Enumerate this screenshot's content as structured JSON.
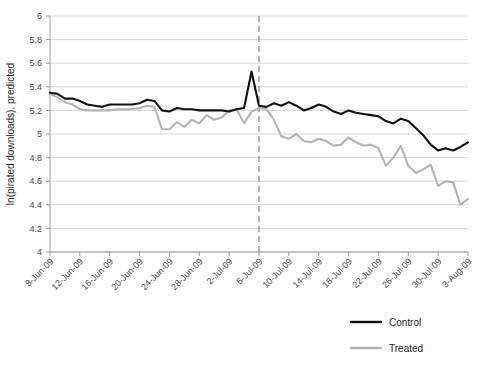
{
  "chart_data": {
    "type": "line",
    "title": "",
    "xlabel": "",
    "ylabel": "ln(pirated downloads), predicted",
    "ylim": [
      4,
      6
    ],
    "ytick_step": 0.2,
    "yticks": [
      "6",
      "5.8",
      "5.6",
      "5.4",
      "5.2",
      "5",
      "4.8",
      "4.6",
      "4.4",
      "4.2",
      "4"
    ],
    "grid": true,
    "legend_position": "bottom-right",
    "x": [
      "8-Jun-09",
      "9-Jun-09",
      "10-Jun-09",
      "11-Jun-09",
      "12-Jun-09",
      "13-Jun-09",
      "14-Jun-09",
      "15-Jun-09",
      "16-Jun-09",
      "17-Jun-09",
      "18-Jun-09",
      "19-Jun-09",
      "20-Jun-09",
      "21-Jun-09",
      "22-Jun-09",
      "23-Jun-09",
      "24-Jun-09",
      "25-Jun-09",
      "26-Jun-09",
      "27-Jun-09",
      "28-Jun-09",
      "29-Jun-09",
      "30-Jun-09",
      "1-Jul-09",
      "2-Jul-09",
      "3-Jul-09",
      "4-Jul-09",
      "5-Jul-09",
      "6-Jul-09",
      "7-Jul-09",
      "8-Jul-09",
      "9-Jul-09",
      "10-Jul-09",
      "11-Jul-09",
      "12-Jul-09",
      "13-Jul-09",
      "14-Jul-09",
      "15-Jul-09",
      "16-Jul-09",
      "17-Jul-09",
      "18-Jul-09",
      "19-Jul-09",
      "20-Jul-09",
      "21-Jul-09",
      "22-Jul-09",
      "23-Jul-09",
      "24-Jul-09",
      "25-Jul-09",
      "26-Jul-09",
      "27-Jul-09",
      "28-Jul-09",
      "29-Jul-09",
      "30-Jul-09",
      "31-Jul-09",
      "1-Aug-09",
      "2-Aug-09",
      "3-Aug-09"
    ],
    "xtick_labels": [
      "8-Jun-09",
      "12-Jun-09",
      "16-Jun-09",
      "20-Jun-09",
      "24-Jun-09",
      "28-Jun-09",
      "2-Jul-09",
      "6-Jul-09",
      "10-Jul-09",
      "14-Jul-09",
      "18-Jul-09",
      "22-Jul-09",
      "26-Jul-09",
      "30-Jul-09",
      "3-Aug-09"
    ],
    "xtick_indices": [
      0,
      4,
      8,
      12,
      16,
      20,
      24,
      28,
      32,
      36,
      40,
      44,
      48,
      52,
      56
    ],
    "series": [
      {
        "name": "Control",
        "color": "#111111",
        "values": [
          5.35,
          5.34,
          5.3,
          5.3,
          5.28,
          5.25,
          5.24,
          5.23,
          5.25,
          5.25,
          5.25,
          5.25,
          5.26,
          5.29,
          5.28,
          5.2,
          5.19,
          5.22,
          5.21,
          5.21,
          5.2,
          5.2,
          5.2,
          5.2,
          5.19,
          5.21,
          5.22,
          5.53,
          5.24,
          5.23,
          5.26,
          5.24,
          5.27,
          5.24,
          5.2,
          5.22,
          5.25,
          5.23,
          5.19,
          5.17,
          5.2,
          5.18,
          5.17,
          5.16,
          5.15,
          5.11,
          5.09,
          5.13,
          5.11,
          5.05,
          4.99,
          4.91,
          4.86,
          4.88,
          4.86,
          4.89,
          4.93
        ]
      },
      {
        "name": "Treated",
        "color": "#b3b3b3",
        "values": [
          5.34,
          5.31,
          5.27,
          5.25,
          5.21,
          5.2,
          5.2,
          5.2,
          5.2,
          5.21,
          5.21,
          5.21,
          5.22,
          5.24,
          5.23,
          5.04,
          5.04,
          5.1,
          5.06,
          5.12,
          5.09,
          5.16,
          5.12,
          5.14,
          5.2,
          5.21,
          5.09,
          5.19,
          5.22,
          5.21,
          5.12,
          4.98,
          4.96,
          5.0,
          4.94,
          4.93,
          4.96,
          4.94,
          4.9,
          4.91,
          4.97,
          4.93,
          4.9,
          4.91,
          4.88,
          4.73,
          4.8,
          4.9,
          4.73,
          4.67,
          4.7,
          4.74,
          4.56,
          4.6,
          4.59,
          4.4,
          4.45
        ]
      }
    ],
    "annotations": [
      {
        "type": "vertical-dashed-line",
        "at_index": 28,
        "at_label": "6-Jul-09",
        "color": "#8c8c8c"
      }
    ]
  },
  "legend": {
    "items": [
      {
        "label": "Control",
        "color": "#111111"
      },
      {
        "label": "Treated",
        "color": "#b3b3b3"
      }
    ]
  }
}
